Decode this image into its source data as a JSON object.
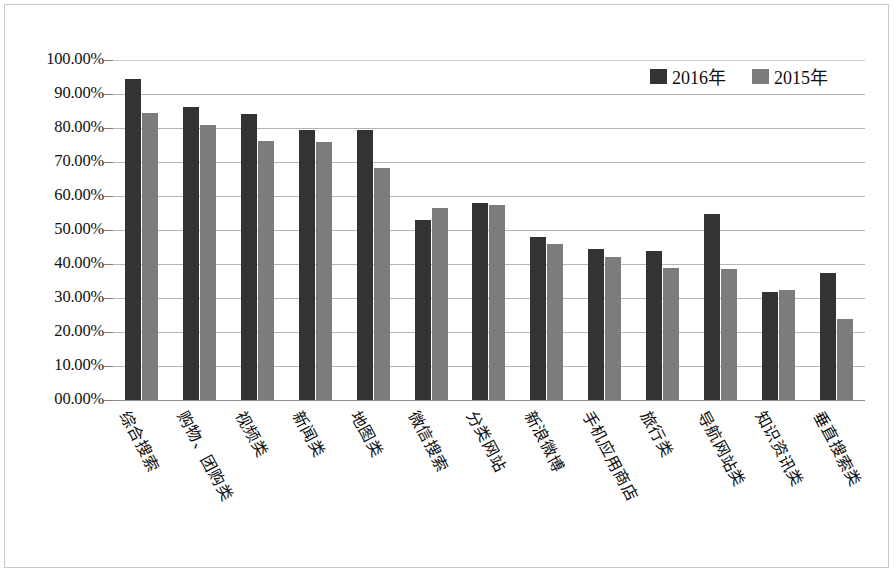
{
  "chart_data": {
    "type": "bar",
    "title": "",
    "xlabel": "",
    "ylabel": "",
    "ylim": [
      0,
      100
    ],
    "grid": true,
    "legend_position": "top-right",
    "categories": [
      "综合搜索",
      "购物、团购类",
      "视频类",
      "新闻类",
      "地图类",
      "微信搜索",
      "分类网站",
      "新浪微博",
      "手机应用商店",
      "旅行类",
      "导航网站类",
      "知识资讯类",
      "垂直搜索类"
    ],
    "tick_labels": [
      "100.00%",
      "90.00%",
      "80.00%",
      "70.00%",
      "60.00%",
      "50.00%",
      "40.00%",
      "30.00%",
      "20.00%",
      "10.00%",
      "00.00%"
    ],
    "tick_values": [
      100,
      90,
      80,
      70,
      60,
      50,
      40,
      30,
      20,
      10,
      0
    ],
    "series": [
      {
        "name": "2016年",
        "color": "#333333",
        "values": [
          94.5,
          86.2,
          84.0,
          79.3,
          79.3,
          53.0,
          58.0,
          47.8,
          44.3,
          43.7,
          54.7,
          31.8,
          37.3
        ]
      },
      {
        "name": "2015年",
        "color": "#7c7c7c",
        "values": [
          84.5,
          81.0,
          76.3,
          76.0,
          68.3,
          56.5,
          57.3,
          46.0,
          42.0,
          38.7,
          38.5,
          32.3,
          23.8
        ]
      }
    ]
  },
  "legend": {
    "entries": [
      {
        "label": "2016年",
        "swatch": "#333333"
      },
      {
        "label": "2015年",
        "swatch": "#7c7c7c"
      }
    ]
  }
}
